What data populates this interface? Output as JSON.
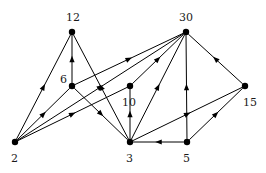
{
  "figure": {
    "width": 266,
    "height": 173,
    "background": "#ffffff",
    "ink_color": "#000000",
    "label_color": "#1a1a1a",
    "node_radius": 3.2,
    "edge_width": 1.0,
    "arrow_size": 6.5
  },
  "chart_data": {
    "type": "diagram",
    "subtype": "directed-graph",
    "title": "",
    "xlabel": "",
    "ylabel": "",
    "grid": false,
    "legend": null,
    "directed": true,
    "node_labels": [
      "12",
      "30",
      "6",
      "10",
      "15",
      "2",
      "3",
      "5"
    ],
    "nodes": [
      {
        "id": "12",
        "label": "12",
        "x": 72,
        "y": 32,
        "label_x": 66,
        "label_y": 12
      },
      {
        "id": "30",
        "label": "30",
        "x": 186,
        "y": 32,
        "label_x": 179,
        "label_y": 12
      },
      {
        "id": "6",
        "label": "6",
        "x": 72,
        "y": 86,
        "label_x": 60,
        "label_y": 74
      },
      {
        "id": "10",
        "label": "10",
        "x": 130,
        "y": 86,
        "label_x": 122,
        "label_y": 97
      },
      {
        "id": "15",
        "label": "15",
        "x": 245,
        "y": 86,
        "label_x": 243,
        "label_y": 97
      },
      {
        "id": "2",
        "label": "2",
        "x": 15,
        "y": 142,
        "label_x": 11,
        "label_y": 153
      },
      {
        "id": "3",
        "label": "3",
        "x": 130,
        "y": 142,
        "label_x": 126,
        "label_y": 153
      },
      {
        "id": "5",
        "label": "5",
        "x": 187,
        "y": 142,
        "label_x": 183,
        "label_y": 153
      }
    ],
    "edges": [
      {
        "from": "2",
        "to": "12"
      },
      {
        "from": "2",
        "to": "6"
      },
      {
        "from": "2",
        "to": "10"
      },
      {
        "from": "2",
        "to": "30"
      },
      {
        "from": "6",
        "to": "12"
      },
      {
        "from": "6",
        "to": "30"
      },
      {
        "from": "6",
        "to": "3"
      },
      {
        "from": "3",
        "to": "12"
      },
      {
        "from": "3",
        "to": "30"
      },
      {
        "from": "3",
        "to": "10"
      },
      {
        "from": "3",
        "to": "15"
      },
      {
        "from": "5",
        "to": "30"
      },
      {
        "from": "5",
        "to": "15"
      },
      {
        "from": "5",
        "to": "3"
      },
      {
        "from": "10",
        "to": "30"
      },
      {
        "from": "15",
        "to": "30"
      }
    ],
    "edge_count": 16,
    "node_count": 8
  }
}
